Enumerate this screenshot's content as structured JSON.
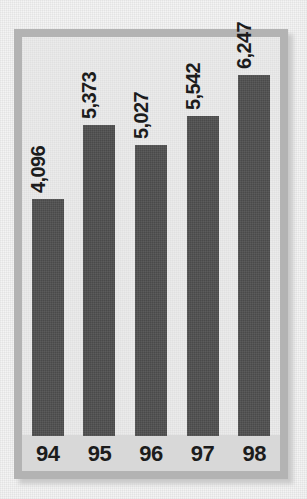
{
  "chart_data": {
    "type": "bar",
    "title": "",
    "subtitle": "",
    "xlabel": "",
    "ylabel": "",
    "categories": [
      "94",
      "95",
      "96",
      "97",
      "98"
    ],
    "values": [
      4096,
      5373,
      5027,
      5542,
      6247
    ],
    "value_labels": [
      "4,096",
      "5,373",
      "5,027",
      "5,542",
      "6,247"
    ],
    "series": [
      {
        "name": "",
        "values": [
          4096,
          5373,
          5027,
          5542,
          6247
        ]
      }
    ],
    "ylim": [
      0,
      6900
    ],
    "grid": false,
    "legend": false,
    "legend_position": "none",
    "value_label_rotation": 90,
    "tick_label_rotation": 0,
    "colors": {
      "bar": "#4a4a4a",
      "plot_background": "#ebebeb",
      "axis_strip": "#d8d8d8",
      "frame": "#b3b3b3",
      "page_background": "#f4f4f4",
      "text": "#1c1c1c"
    }
  },
  "figure": {
    "bars": [
      {
        "category": "94",
        "label": "4,096",
        "value": 4096
      },
      {
        "category": "95",
        "label": "5,373",
        "value": 5373
      },
      {
        "category": "96",
        "label": "5,027",
        "value": 5027
      },
      {
        "category": "97",
        "label": "5,542",
        "value": 5542
      },
      {
        "category": "98",
        "label": "6,247",
        "value": 6247
      }
    ]
  }
}
